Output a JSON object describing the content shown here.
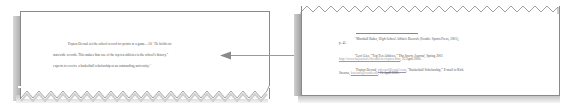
{
  "left_page": {
    "lines": [
      "Payton Devaul set the school record for points in a game—50.",
      "statewide records.  This makes him one of the top ten athletes in the school's history.",
      "expects to receive a basketball scholarship at an outstanding university."
    ],
    "line1_tail": " He holds six",
    "superscripts": [
      "1",
      "2",
      "3"
    ]
  },
  "right_page": {
    "footnotes": [
      {
        "number": "1",
        "text_a": "Marshall Baker, ",
        "title": "High School Athletic Records",
        "text_b": " (Seattle:  Sports Press, 2001),",
        "line2": "p. 41."
      },
      {
        "number": "2",
        "text_a": "Lori Gies, “Top Ten Athletes,” ",
        "title": "The Sports Journal",
        "text_b": ", Spring 2001",
        "link": "http://www.hsjournal.edu/athletes/topten.htm",
        "line2_tail": ", 25 April 2001."
      },
      {
        "number": "3",
        "text_a": "Payton Devaul, ",
        "link_a": "pdevaul@email.com",
        "text_b": ", “Basketball Scholarship,”  E-mail to Kirk",
        "line2_head": "Stearns, ",
        "link_b": "kstearns@south.edu",
        "line2_tail": ", 15 April 2001."
      }
    ]
  },
  "colors": {
    "border": "#8a8a8a",
    "shadow": "#a8a8a8",
    "arrow": "#9a9a9a",
    "text": "#555555"
  }
}
